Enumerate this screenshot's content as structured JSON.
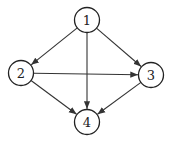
{
  "diagram": {
    "type": "directed-graph",
    "node_radius": 12.5,
    "colors": {
      "stroke": "#222222",
      "fill": "#ffffff",
      "edge": "#333333"
    },
    "nodes": [
      {
        "id": "1",
        "label": "1",
        "x": 87,
        "y": 20
      },
      {
        "id": "2",
        "label": "2",
        "x": 21,
        "y": 73
      },
      {
        "id": "3",
        "label": "3",
        "x": 151,
        "y": 75
      },
      {
        "id": "4",
        "label": "4",
        "x": 87,
        "y": 122
      }
    ],
    "edges": [
      {
        "from": "1",
        "to": "2"
      },
      {
        "from": "1",
        "to": "3"
      },
      {
        "from": "1",
        "to": "4"
      },
      {
        "from": "2",
        "to": "3"
      },
      {
        "from": "2",
        "to": "4"
      },
      {
        "from": "3",
        "to": "4"
      }
    ]
  }
}
